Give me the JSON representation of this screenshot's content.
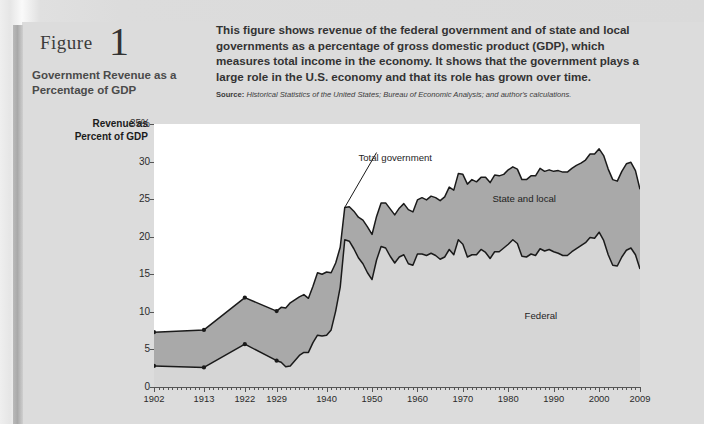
{
  "figure": {
    "label": "Figure",
    "number": "1",
    "subtitle": "Government Revenue as a Percentage of GDP",
    "description": "This figure shows revenue of the federal government and of state and local governments as a percentage of gross domestic product (GDP), which measures total income in the economy. It shows that the government plays a large role in the U.S. economy and that its role has grown over time.",
    "source_label": "Source:",
    "source_text": "Historical Statistics of the United States; Bureau of Economic Analysis; and author's calculations."
  },
  "colors": {
    "page": "#dcdcdc",
    "plot_background": "#ffffff",
    "federal_fill": "#d6d6d6",
    "state_local_fill": "#a9a9a9",
    "line": "#1a1a1a"
  },
  "chart_data": {
    "type": "area",
    "title": "Government Revenue as a Percentage of GDP",
    "xlabel": "",
    "ylabel": "Revenue as Percent of GDP",
    "grid": false,
    "legend_position": "inline-annotations",
    "xlim": [
      1902,
      2009
    ],
    "ylim": [
      0,
      35
    ],
    "yticks": [
      "0",
      "5",
      "10",
      "15",
      "20",
      "25",
      "30",
      "35%"
    ],
    "ytick_values": [
      0,
      5,
      10,
      15,
      20,
      25,
      30,
      35
    ],
    "xticks": [
      "1902",
      "1913",
      "1922",
      "1929",
      "1940",
      "1950",
      "1960",
      "1970",
      "1980",
      "1990",
      "2000",
      "2009"
    ],
    "xtick_values": [
      1902,
      1913,
      1922,
      1929,
      1940,
      1950,
      1960,
      1970,
      1980,
      1990,
      2000,
      2009
    ],
    "annotations": [
      {
        "text": "Total government",
        "x": 1947,
        "y": 30.5
      },
      {
        "text": "State and local",
        "x": 1984,
        "y": 25.0
      },
      {
        "text": "Federal",
        "x": 1988,
        "y": 9.5
      }
    ],
    "stacking": "Federal is the lower band; State and local is stacked above it; the upper outline is Total government.",
    "x": [
      1902,
      1913,
      1922,
      1929,
      1930,
      1931,
      1932,
      1933,
      1934,
      1935,
      1936,
      1937,
      1938,
      1939,
      1940,
      1941,
      1942,
      1943,
      1944,
      1945,
      1946,
      1947,
      1948,
      1949,
      1950,
      1951,
      1952,
      1953,
      1954,
      1955,
      1956,
      1957,
      1958,
      1959,
      1960,
      1961,
      1962,
      1963,
      1964,
      1965,
      1966,
      1967,
      1968,
      1969,
      1970,
      1971,
      1972,
      1973,
      1974,
      1975,
      1976,
      1977,
      1978,
      1979,
      1980,
      1981,
      1982,
      1983,
      1984,
      1985,
      1986,
      1987,
      1988,
      1989,
      1990,
      1991,
      1992,
      1993,
      1994,
      1995,
      1996,
      1997,
      1998,
      1999,
      2000,
      2001,
      2002,
      2003,
      2004,
      2005,
      2006,
      2007,
      2008,
      2009
    ],
    "series": [
      {
        "name": "Federal",
        "values": [
          2.8,
          2.6,
          5.7,
          3.5,
          3.3,
          2.7,
          2.8,
          3.5,
          4.2,
          4.6,
          4.6,
          5.9,
          6.9,
          6.8,
          6.9,
          7.6,
          10.1,
          13.3,
          19.6,
          19.4,
          18.4,
          17.2,
          16.4,
          15.2,
          14.3,
          16.9,
          18.7,
          18.5,
          17.4,
          16.5,
          17.3,
          17.6,
          16.4,
          16.2,
          17.7,
          17.7,
          17.5,
          17.8,
          17.5,
          17.0,
          17.3,
          18.3,
          17.6,
          19.6,
          19.0,
          17.3,
          17.6,
          17.6,
          18.3,
          17.9,
          17.1,
          18.0,
          18.0,
          18.5,
          19.0,
          19.6,
          19.1,
          17.4,
          17.3,
          17.7,
          17.5,
          18.4,
          18.1,
          18.3,
          18.0,
          17.8,
          17.5,
          17.5,
          18.0,
          18.4,
          18.8,
          19.2,
          19.9,
          19.8,
          20.6,
          19.5,
          17.6,
          16.2,
          16.1,
          17.3,
          18.2,
          18.5,
          17.6,
          15.7
        ]
      },
      {
        "name": "State and local",
        "values": [
          4.5,
          5.0,
          6.2,
          6.6,
          7.3,
          7.8,
          8.4,
          8.1,
          7.8,
          7.7,
          7.2,
          7.5,
          8.3,
          8.2,
          8.4,
          7.6,
          6.4,
          5.3,
          4.3,
          4.6,
          5.0,
          5.4,
          5.8,
          6.1,
          6.0,
          5.8,
          5.8,
          6.0,
          6.3,
          6.4,
          6.5,
          6.8,
          7.2,
          7.1,
          7.2,
          7.5,
          7.4,
          7.6,
          7.7,
          7.8,
          8.0,
          8.3,
          8.6,
          8.8,
          9.3,
          9.7,
          10.0,
          9.7,
          9.6,
          10.0,
          10.1,
          10.2,
          10.1,
          9.8,
          9.9,
          9.7,
          9.9,
          10.2,
          10.3,
          10.4,
          10.6,
          10.7,
          10.6,
          10.6,
          10.7,
          11.0,
          11.1,
          11.1,
          11.1,
          11.1,
          11.0,
          11.0,
          11.1,
          11.2,
          11.1,
          11.3,
          11.4,
          11.4,
          11.3,
          11.4,
          11.5,
          11.4,
          11.2,
          10.6
        ]
      }
    ],
    "total_government": [
      7.3,
      7.6,
      11.9,
      10.1,
      10.6,
      10.5,
      11.2,
      11.6,
      12.0,
      12.3,
      11.8,
      13.4,
      15.2,
      15.0,
      15.3,
      15.2,
      16.5,
      18.6,
      23.9,
      24.0,
      23.4,
      22.6,
      22.2,
      21.3,
      20.3,
      22.7,
      24.5,
      24.5,
      23.7,
      22.9,
      23.8,
      24.4,
      23.6,
      23.3,
      24.9,
      25.2,
      24.9,
      25.4,
      25.2,
      24.8,
      25.3,
      26.6,
      26.2,
      28.4,
      28.3,
      27.0,
      27.6,
      27.3,
      27.9,
      27.9,
      27.2,
      28.2,
      28.1,
      28.3,
      28.9,
      29.3,
      29.0,
      27.6,
      27.6,
      28.1,
      28.1,
      29.1,
      28.7,
      28.9,
      28.7,
      28.8,
      28.6,
      28.6,
      29.1,
      29.5,
      29.8,
      30.2,
      31.0,
      31.0,
      31.7,
      30.8,
      29.0,
      27.6,
      27.4,
      28.7,
      29.7,
      29.9,
      28.8,
      26.3
    ]
  }
}
